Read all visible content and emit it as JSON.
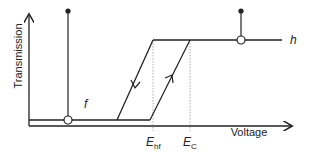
{
  "diagram": {
    "type": "hysteresis-transmission-vs-voltage",
    "y_axis_label": "Transmission",
    "x_axis_label": "Voltage",
    "curves": [
      {
        "id": "f",
        "label": "f",
        "state": "low transmission"
      },
      {
        "id": "h",
        "label": "h",
        "state": "high transmission"
      }
    ],
    "thresholds": [
      {
        "id": "Ehf",
        "base": "E",
        "subscript": "hf"
      },
      {
        "id": "Ec",
        "base": "E",
        "subscript": "C"
      }
    ],
    "direction_arrows": [
      {
        "on": "left-branch",
        "direction": "down"
      },
      {
        "on": "right-branch",
        "direction": "up"
      }
    ],
    "colors": {
      "line": "#222222",
      "guide": "#999999",
      "background": "#ffffff"
    }
  }
}
